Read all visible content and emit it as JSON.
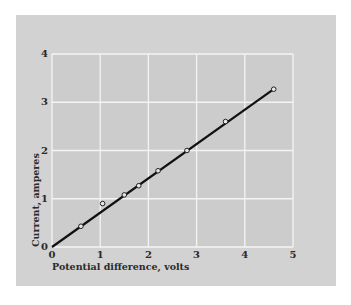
{
  "chart_data": {
    "type": "scatter",
    "title": "",
    "xlabel": "Potential difference, volts",
    "ylabel": "Current, amperes",
    "xlim": [
      0,
      5
    ],
    "ylim": [
      0,
      4
    ],
    "xticks": [
      0,
      1,
      2,
      3,
      4,
      5
    ],
    "yticks": [
      0,
      1,
      2,
      3,
      4
    ],
    "grid": true,
    "legend": null,
    "series": [
      {
        "name": "Measurements",
        "marker": "open-circle",
        "x": [
          0.6,
          1.05,
          1.5,
          1.8,
          2.2,
          2.8,
          3.6,
          4.6
        ],
        "y": [
          0.43,
          0.9,
          1.08,
          1.27,
          1.58,
          2.0,
          2.6,
          3.27
        ]
      },
      {
        "name": "Best-fit line",
        "style": "line",
        "x": [
          0,
          4.6
        ],
        "y": [
          0,
          3.27
        ]
      }
    ],
    "colors": {
      "panel": "#d2d2d2",
      "plot_bg": "#cccccc",
      "grid": "#f4f4f4",
      "line": "#111111",
      "text": "#2a2a2a"
    }
  }
}
